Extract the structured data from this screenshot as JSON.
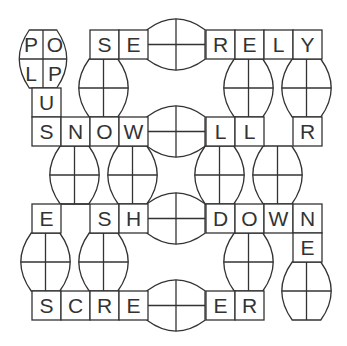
{
  "puzzle": {
    "title": "Word grid puzzle",
    "grid": {
      "origin_x": 32,
      "origin_y": 30,
      "cell": 29,
      "cols": 10,
      "rows": 10
    },
    "colors": {
      "line": "#333333",
      "text": "#333333",
      "background": "#ffffff"
    },
    "cells": [
      {
        "row": 0,
        "col": 2,
        "letter": "S"
      },
      {
        "row": 0,
        "col": 3,
        "letter": "E"
      },
      {
        "row": 0,
        "col": 6,
        "letter": "R"
      },
      {
        "row": 0,
        "col": 7,
        "letter": "E"
      },
      {
        "row": 0,
        "col": 8,
        "letter": "L"
      },
      {
        "row": 0,
        "col": 9,
        "letter": "Y"
      },
      {
        "row": 2,
        "col": 0,
        "letter": "U"
      },
      {
        "row": 3,
        "col": 0,
        "letter": "S"
      },
      {
        "row": 3,
        "col": 1,
        "letter": "N"
      },
      {
        "row": 3,
        "col": 2,
        "letter": "O"
      },
      {
        "row": 3,
        "col": 3,
        "letter": "W"
      },
      {
        "row": 3,
        "col": 6,
        "letter": "L"
      },
      {
        "row": 3,
        "col": 7,
        "letter": "L"
      },
      {
        "row": 3,
        "col": 9,
        "letter": "R"
      },
      {
        "row": 6,
        "col": 0,
        "letter": "E"
      },
      {
        "row": 6,
        "col": 2,
        "letter": "S"
      },
      {
        "row": 6,
        "col": 3,
        "letter": "H"
      },
      {
        "row": 6,
        "col": 6,
        "letter": "D"
      },
      {
        "row": 6,
        "col": 7,
        "letter": "O"
      },
      {
        "row": 6,
        "col": 8,
        "letter": "W"
      },
      {
        "row": 6,
        "col": 9,
        "letter": "N"
      },
      {
        "row": 7,
        "col": 9,
        "letter": "E"
      },
      {
        "row": 9,
        "col": 0,
        "letter": "S"
      },
      {
        "row": 9,
        "col": 1,
        "letter": "C"
      },
      {
        "row": 9,
        "col": 2,
        "letter": "R"
      },
      {
        "row": 9,
        "col": 3,
        "letter": "E"
      },
      {
        "row": 9,
        "col": 6,
        "letter": "E"
      },
      {
        "row": 9,
        "col": 7,
        "letter": "R"
      }
    ],
    "ovals": [
      {
        "type": "vertical",
        "cx": 43,
        "cy": 59,
        "w": 50,
        "h": 58,
        "letters": [
          "P",
          "O",
          "L",
          "P"
        ]
      },
      {
        "type": "horizontal",
        "cx": 176,
        "cy": 44.5,
        "w": 58,
        "h": 54,
        "letters": [
          "",
          "",
          "",
          ""
        ]
      },
      {
        "type": "horizontal",
        "cx": 176,
        "cy": 131.5,
        "w": 58,
        "h": 54,
        "letters": [
          "",
          "",
          "",
          ""
        ]
      },
      {
        "type": "horizontal",
        "cx": 176,
        "cy": 218.5,
        "w": 58,
        "h": 54,
        "letters": [
          "",
          "",
          "",
          ""
        ]
      },
      {
        "type": "horizontal",
        "cx": 176,
        "cy": 305.5,
        "w": 58,
        "h": 54,
        "letters": [
          "",
          "",
          "",
          ""
        ]
      },
      {
        "type": "vertical",
        "cx": 103.5,
        "cy": 88,
        "w": 52,
        "h": 58,
        "letters": [
          "",
          "",
          "",
          ""
        ]
      },
      {
        "type": "vertical",
        "cx": 248.5,
        "cy": 88,
        "w": 52,
        "h": 58,
        "letters": [
          "",
          "",
          "",
          ""
        ]
      },
      {
        "type": "vertical",
        "cx": 306.5,
        "cy": 88,
        "w": 52,
        "h": 58,
        "letters": [
          "",
          "",
          "",
          ""
        ]
      },
      {
        "type": "vertical",
        "cx": 74.5,
        "cy": 175,
        "w": 52,
        "h": 58,
        "letters": [
          "",
          "",
          "",
          ""
        ]
      },
      {
        "type": "vertical",
        "cx": 132.5,
        "cy": 175,
        "w": 52,
        "h": 58,
        "letters": [
          "",
          "",
          "",
          ""
        ]
      },
      {
        "type": "vertical",
        "cx": 219.5,
        "cy": 175,
        "w": 52,
        "h": 58,
        "letters": [
          "",
          "",
          "",
          ""
        ]
      },
      {
        "type": "vertical",
        "cx": 277.5,
        "cy": 175,
        "w": 52,
        "h": 58,
        "letters": [
          "",
          "",
          "",
          ""
        ]
      },
      {
        "type": "vertical",
        "cx": 45.5,
        "cy": 262,
        "w": 52,
        "h": 58,
        "letters": [
          "",
          "",
          "",
          ""
        ]
      },
      {
        "type": "vertical",
        "cx": 103.5,
        "cy": 262,
        "w": 52,
        "h": 58,
        "letters": [
          "",
          "",
          "",
          ""
        ]
      },
      {
        "type": "vertical",
        "cx": 248.5,
        "cy": 262,
        "w": 52,
        "h": 58,
        "letters": [
          "",
          "",
          "",
          ""
        ]
      },
      {
        "type": "vertical",
        "cx": 306.5,
        "cy": 291,
        "w": 52,
        "h": 58,
        "letters": [
          "",
          "",
          "",
          ""
        ]
      }
    ],
    "open_tops": [
      {
        "row": 6,
        "col": 1
      }
    ]
  }
}
